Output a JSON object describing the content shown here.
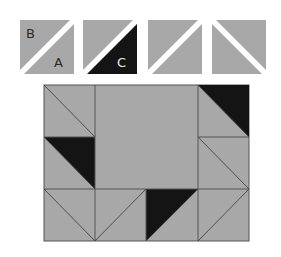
{
  "colors": {
    "gray": "#a8a8a8",
    "black": "#141414",
    "line": "#555555",
    "background": "#ffffff",
    "label_on_gray": "#2a2a2a",
    "label_on_black": "#e8e8e8"
  },
  "top_pieces": [
    {
      "id": "piece-1",
      "diagonal": "bl-tr",
      "upper": "gray",
      "lower": "gray",
      "upper_label": "B",
      "lower_label": "A"
    },
    {
      "id": "piece-2",
      "diagonal": "bl-tr",
      "upper": "gray",
      "lower": "black",
      "upper_label": "",
      "lower_label": "C"
    },
    {
      "id": "piece-3",
      "diagonal": "bl-tr",
      "upper": "gray",
      "lower": "gray",
      "upper_label": "",
      "lower_label": ""
    },
    {
      "id": "piece-4",
      "diagonal": "tl-br",
      "upper": "gray",
      "lower": "gray",
      "upper_label": "",
      "lower_label": ""
    }
  ],
  "labels": {
    "a": "A",
    "b": "B",
    "c": "C"
  },
  "block": {
    "columns": 4,
    "rows": 3,
    "center": "2x2 plain gray square"
  }
}
